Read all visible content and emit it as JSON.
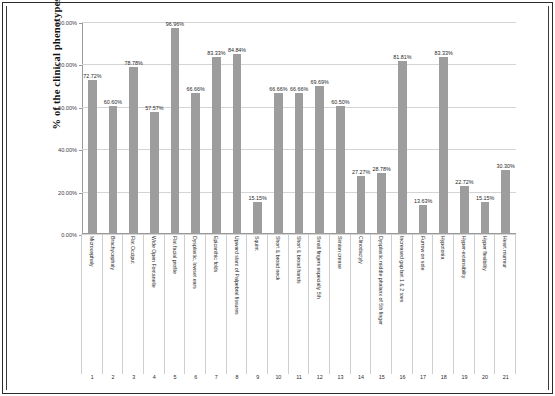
{
  "chart_data": {
    "type": "bar",
    "title": "",
    "xlabel": "",
    "ylabel": "% of the clinical phenotypes",
    "ylim": [
      0,
      100
    ],
    "ytick_labels": [
      "0.00%",
      "20.00%",
      "40.00%",
      "60.00%",
      "80.00%",
      "100.00%"
    ],
    "ytick_values": [
      0,
      20,
      40,
      60,
      80,
      100
    ],
    "grid": true,
    "legend": "none",
    "bar_color": "#9d9d9d",
    "categories": [
      "Microcephaly",
      "Brachycephaly",
      "Flat Occiput",
      "Wide Open Fontanelle",
      "Flat facial profile",
      "Dysplastic, lowset ears",
      "Epicanthic folds",
      "Upward slant of Palpebral fissures",
      "Squint",
      "Short & broad neck",
      "Short & broad hands",
      "Small fingers especially 5th",
      "Simian crease",
      "Clinodactyly",
      "Dysplastic middle phalanx of 5th finger",
      "Increased gap bet 1 & 2 toes",
      "Furrow on sole",
      "Hypotonia",
      "Hyper-extensibility",
      "Hyper flexibility",
      "Heart murmur"
    ],
    "indices": [
      "1",
      "2",
      "3",
      "4",
      "5",
      "6",
      "7",
      "8",
      "9",
      "10",
      "11",
      "12",
      "13",
      "14",
      "15",
      "16",
      "17",
      "18",
      "19",
      "20",
      "21"
    ],
    "values": [
      72.72,
      60.6,
      78.78,
      57.57,
      96.96,
      66.66,
      83.33,
      84.84,
      15.15,
      66.66,
      66.66,
      69.69,
      60.6,
      27.27,
      28.78,
      81.81,
      13.63,
      83.33,
      22.72,
      15.15,
      30.3
    ],
    "data_labels": [
      "72.72%",
      "60.60%",
      "78.78%",
      "57.57%",
      "96.96%",
      "66.66%",
      "83.33%",
      "84.84%",
      "15.15%",
      "66.66%",
      "66.66%",
      "69.69%",
      "60.50%",
      "27.27%",
      "28.78%",
      "81.81%",
      "13.63%",
      "83.33%",
      "22.72%",
      "15.15%",
      "30.30%"
    ]
  }
}
